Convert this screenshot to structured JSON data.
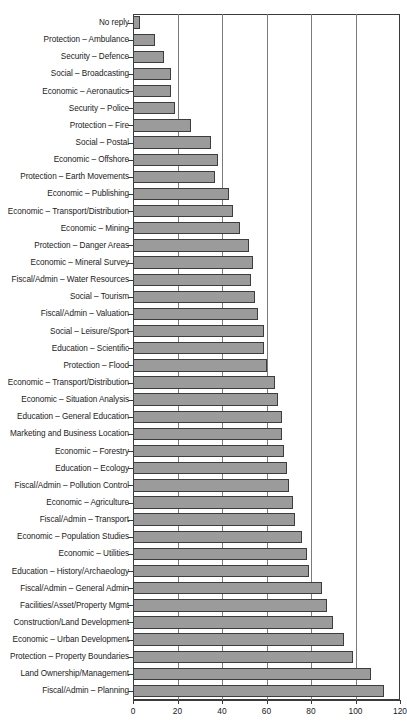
{
  "chart_data": {
    "type": "bar",
    "orientation": "horizontal",
    "title": "",
    "xlabel": "",
    "ylabel": "",
    "xlim": [
      0,
      120
    ],
    "xticks": [
      0,
      20,
      40,
      60,
      80,
      100,
      120
    ],
    "grid": true,
    "legend": false,
    "bar_color": "#9b9b9b",
    "bar_edge_color": "#3d3d3d",
    "categories": [
      "No reply",
      "Protection – Ambulance",
      "Security – Defence",
      "Social – Broadcasting",
      "Economic – Aeronautics",
      "Security – Police",
      "Protection – Fire",
      "Social – Postal",
      "Economic – Offshore",
      "Protection – Earth Movements",
      "Economic – Publishing",
      "Economic – Transport/Distribution",
      "Economic – Mining",
      "Protection – Danger Areas",
      "Economic – Mineral Survey",
      "Fiscal/Admin – Water Resources",
      "Social – Tourism",
      "Fiscal/Admin – Valuation",
      "Social – Leisure/Sport",
      "Education – Scientific",
      "Protection – Flood",
      "Economic – Transport/Distribution",
      "Economic – Situation Analysis",
      "Education – General Education",
      "Marketing and Business Location",
      "Economic – Forestry",
      "Education – Ecology",
      "Fiscal/Admin – Pollution Control",
      "Economic – Agriculture",
      "Fiscal/Admin – Transport",
      "Economic – Population Studies",
      "Economic – Utilities",
      "Education – History/Archaeology",
      "Fiscal/Admin – General Admin",
      "Facilities/Asset/Property Mgmt",
      "Construction/Land Development",
      "Economic – Urban Development",
      "Protection – Property Boundaries",
      "Land Ownership/Management",
      "Fiscal/Admin – Planning"
    ],
    "values": [
      3,
      10,
      14,
      17,
      17,
      19,
      26,
      35,
      38,
      37,
      43,
      45,
      48,
      52,
      54,
      53,
      55,
      56,
      59,
      59,
      60,
      64,
      65,
      67,
      67,
      68,
      69,
      70,
      72,
      73,
      76,
      78,
      79,
      85,
      87,
      90,
      95,
      99,
      107,
      113
    ]
  }
}
